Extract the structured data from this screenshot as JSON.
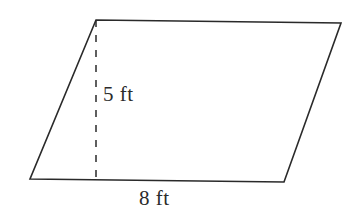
{
  "figure": {
    "name": "parallelogram-with-height",
    "shape_type": "parallelogram",
    "background_color": "#ffffff",
    "stroke_color": "#2a2a2a",
    "stroke_width": 1.6,
    "label_color": "#2b2b2b",
    "vertices": {
      "top_left": {
        "x": 96,
        "y": 20
      },
      "top_right": {
        "x": 341,
        "y": 23
      },
      "bottom_right": {
        "x": 284,
        "y": 182
      },
      "bottom_left": {
        "x": 30,
        "y": 179
      }
    },
    "height_line": {
      "name": "height-dashed-line",
      "style": "dashed",
      "dash_length": 7,
      "gap_length": 8,
      "x1": 96,
      "y1": 20,
      "x2": 96,
      "y2": 180
    },
    "labels": {
      "height": {
        "text": "5 ft",
        "value": 5,
        "unit": "ft",
        "x": 103,
        "y": 84
      },
      "base": {
        "text": "8 ft",
        "value": 8,
        "unit": "ft",
        "x": 139,
        "y": 188
      }
    },
    "polygon_points": "96,20 341,23 284,182 30,179"
  }
}
